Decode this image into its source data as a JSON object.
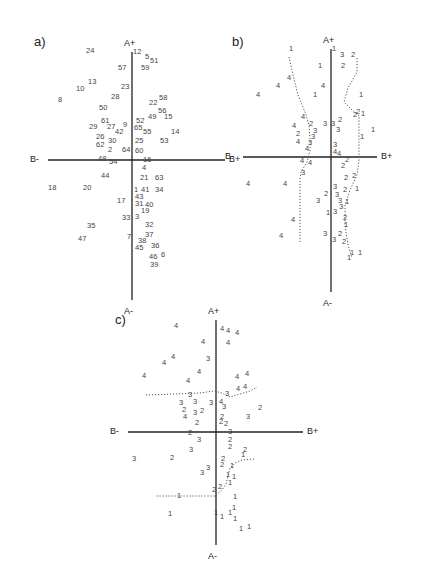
{
  "figure": {
    "panels": [
      {
        "id": "a",
        "label": "a)",
        "axes": {
          "top": "A+",
          "bottom": "A-",
          "left": "B-",
          "right": "B+"
        },
        "origin": [
          132,
          160
        ],
        "vline": [
          52,
          300
        ],
        "hline": [
          48,
          225
        ],
        "label_pos": [
          34,
          34
        ],
        "points": [
          {
            "t": "24",
            "x": 86,
            "y": 51
          },
          {
            "t": "12",
            "x": 133,
            "y": 52
          },
          {
            "t": "5",
            "x": 145,
            "y": 57
          },
          {
            "t": "51",
            "x": 150,
            "y": 61
          },
          {
            "t": "57",
            "x": 118,
            "y": 68
          },
          {
            "t": "59",
            "x": 141,
            "y": 68
          },
          {
            "t": "13",
            "x": 88,
            "y": 82
          },
          {
            "t": "10",
            "x": 76,
            "y": 89
          },
          {
            "t": "23",
            "x": 121,
            "y": 87
          },
          {
            "t": "8",
            "x": 58,
            "y": 100
          },
          {
            "t": "28",
            "x": 111,
            "y": 97
          },
          {
            "t": "22",
            "x": 149,
            "y": 103
          },
          {
            "t": "58",
            "x": 159,
            "y": 98
          },
          {
            "t": "50",
            "x": 99,
            "y": 108
          },
          {
            "t": "56",
            "x": 158,
            "y": 111
          },
          {
            "t": "49",
            "x": 148,
            "y": 117
          },
          {
            "t": "15",
            "x": 164,
            "y": 117
          },
          {
            "t": "61",
            "x": 101,
            "y": 121
          },
          {
            "t": "52",
            "x": 136,
            "y": 121
          },
          {
            "t": "9",
            "x": 123,
            "y": 125
          },
          {
            "t": "29",
            "x": 89,
            "y": 127
          },
          {
            "t": "27",
            "x": 107,
            "y": 127
          },
          {
            "t": "65",
            "x": 134,
            "y": 128
          },
          {
            "t": "42",
            "x": 115,
            "y": 132
          },
          {
            "t": "55",
            "x": 143,
            "y": 132
          },
          {
            "t": "14",
            "x": 171,
            "y": 132
          },
          {
            "t": "26",
            "x": 96,
            "y": 137
          },
          {
            "t": "30",
            "x": 108,
            "y": 141
          },
          {
            "t": "25",
            "x": 135,
            "y": 141
          },
          {
            "t": "53",
            "x": 160,
            "y": 141
          },
          {
            "t": "62",
            "x": 96,
            "y": 145
          },
          {
            "t": "2",
            "x": 108,
            "y": 150
          },
          {
            "t": "64",
            "x": 122,
            "y": 150
          },
          {
            "t": "60",
            "x": 135,
            "y": 151
          },
          {
            "t": "48",
            "x": 98,
            "y": 159
          },
          {
            "t": "54",
            "x": 109,
            "y": 162
          },
          {
            "t": "16",
            "x": 143,
            "y": 160
          },
          {
            "t": "4",
            "x": 142,
            "y": 168
          },
          {
            "t": "44",
            "x": 101,
            "y": 176
          },
          {
            "t": "21",
            "x": 140,
            "y": 178
          },
          {
            "t": "63",
            "x": 155,
            "y": 178
          },
          {
            "t": "18",
            "x": 48,
            "y": 188
          },
          {
            "t": "20",
            "x": 83,
            "y": 188
          },
          {
            "t": "1",
            "x": 134,
            "y": 190
          },
          {
            "t": "41",
            "x": 141,
            "y": 190
          },
          {
            "t": "34",
            "x": 155,
            "y": 190
          },
          {
            "t": "43",
            "x": 135,
            "y": 197
          },
          {
            "t": "17",
            "x": 117,
            "y": 201
          },
          {
            "t": "31",
            "x": 135,
            "y": 204
          },
          {
            "t": "40",
            "x": 145,
            "y": 205
          },
          {
            "t": "19",
            "x": 141,
            "y": 211
          },
          {
            "t": "3",
            "x": 135,
            "y": 217
          },
          {
            "t": "33",
            "x": 122,
            "y": 218
          },
          {
            "t": "35",
            "x": 87,
            "y": 226
          },
          {
            "t": "32",
            "x": 145,
            "y": 225
          },
          {
            "t": "37",
            "x": 145,
            "y": 235
          },
          {
            "t": "7",
            "x": 127,
            "y": 237
          },
          {
            "t": "47",
            "x": 78,
            "y": 239
          },
          {
            "t": "38",
            "x": 138,
            "y": 241
          },
          {
            "t": "36",
            "x": 151,
            "y": 246
          },
          {
            "t": "45",
            "x": 135,
            "y": 248
          },
          {
            "t": "46",
            "x": 149,
            "y": 257
          },
          {
            "t": "6",
            "x": 161,
            "y": 255
          },
          {
            "t": "39",
            "x": 150,
            "y": 265
          }
        ]
      },
      {
        "id": "b",
        "label": "b)",
        "axes": {
          "top": "A+",
          "bottom": "A-",
          "left": "B-",
          "right": "B+"
        },
        "origin": [
          331,
          157
        ],
        "vline": [
          49,
          292
        ],
        "hline": [
          243,
          377
        ],
        "label_pos": [
          232,
          34
        ],
        "points": [
          {
            "t": "1",
            "x": 289,
            "y": 49
          },
          {
            "t": "1",
            "x": 332,
            "y": 49
          },
          {
            "t": "3",
            "x": 340,
            "y": 55
          },
          {
            "t": "2",
            "x": 351,
            "y": 55
          },
          {
            "t": "1",
            "x": 318,
            "y": 66
          },
          {
            "t": "2",
            "x": 341,
            "y": 66
          },
          {
            "t": "4",
            "x": 287,
            "y": 78
          },
          {
            "t": "4",
            "x": 276,
            "y": 86
          },
          {
            "t": "4",
            "x": 321,
            "y": 86
          },
          {
            "t": "4",
            "x": 256,
            "y": 95
          },
          {
            "t": "1",
            "x": 313,
            "y": 95
          },
          {
            "t": "1",
            "x": 359,
            "y": 95
          },
          {
            "t": "2",
            "x": 356,
            "y": 112
          },
          {
            "t": "2",
            "x": 353,
            "y": 115
          },
          {
            "t": "1",
            "x": 361,
            "y": 114
          },
          {
            "t": "4",
            "x": 301,
            "y": 117
          },
          {
            "t": "2",
            "x": 309,
            "y": 124
          },
          {
            "t": "3",
            "x": 323,
            "y": 124
          },
          {
            "t": "3",
            "x": 331,
            "y": 124
          },
          {
            "t": "2",
            "x": 338,
            "y": 120
          },
          {
            "t": "4",
            "x": 292,
            "y": 126
          },
          {
            "t": "3",
            "x": 313,
            "y": 131
          },
          {
            "t": "3",
            "x": 336,
            "y": 130
          },
          {
            "t": "1",
            "x": 371,
            "y": 130
          },
          {
            "t": "2",
            "x": 296,
            "y": 134
          },
          {
            "t": "3",
            "x": 311,
            "y": 137
          },
          {
            "t": "1",
            "x": 360,
            "y": 137
          },
          {
            "t": "4",
            "x": 296,
            "y": 142
          },
          {
            "t": "3",
            "x": 308,
            "y": 143
          },
          {
            "t": "3",
            "x": 333,
            "y": 145
          },
          {
            "t": "4",
            "x": 305,
            "y": 149
          },
          {
            "t": "4",
            "x": 333,
            "y": 152
          },
          {
            "t": "4",
            "x": 337,
            "y": 154
          },
          {
            "t": "4",
            "x": 300,
            "y": 161
          },
          {
            "t": "4",
            "x": 308,
            "y": 163
          },
          {
            "t": "2",
            "x": 345,
            "y": 160
          },
          {
            "t": "2",
            "x": 341,
            "y": 166
          },
          {
            "t": "3",
            "x": 301,
            "y": 173
          },
          {
            "t": "2",
            "x": 352,
            "y": 176
          },
          {
            "t": "2",
            "x": 344,
            "y": 178
          },
          {
            "t": "4",
            "x": 246,
            "y": 184
          },
          {
            "t": "4",
            "x": 283,
            "y": 184
          },
          {
            "t": "3",
            "x": 333,
            "y": 187
          },
          {
            "t": "2",
            "x": 343,
            "y": 190
          },
          {
            "t": "1",
            "x": 355,
            "y": 189
          },
          {
            "t": "2",
            "x": 324,
            "y": 194
          },
          {
            "t": "3",
            "x": 335,
            "y": 195
          },
          {
            "t": "3",
            "x": 316,
            "y": 201
          },
          {
            "t": "3",
            "x": 338,
            "y": 201
          },
          {
            "t": "1",
            "x": 345,
            "y": 202
          },
          {
            "t": "3",
            "x": 339,
            "y": 207
          },
          {
            "t": "1",
            "x": 326,
            "y": 213
          },
          {
            "t": "3",
            "x": 333,
            "y": 212
          },
          {
            "t": "2",
            "x": 343,
            "y": 218
          },
          {
            "t": "4",
            "x": 291,
            "y": 220
          },
          {
            "t": "1",
            "x": 344,
            "y": 225
          },
          {
            "t": "3",
            "x": 323,
            "y": 234
          },
          {
            "t": "2",
            "x": 338,
            "y": 234
          },
          {
            "t": "4",
            "x": 279,
            "y": 236
          },
          {
            "t": "3",
            "x": 332,
            "y": 240
          },
          {
            "t": "2",
            "x": 342,
            "y": 242
          },
          {
            "t": "1",
            "x": 350,
            "y": 253
          },
          {
            "t": "1",
            "x": 358,
            "y": 253
          },
          {
            "t": "1",
            "x": 347,
            "y": 258
          }
        ],
        "dotted_paths": [
          "M289,57 L293,75 L298,95 L305,112 L309,125 L310,140 L310,150 L307,162 L301,172 L300,180 L300,242",
          "M357,58 L357,72 L348,88 L344,102 L352,110 L359,116 L359,135 L359,160 L357,175 L350,190 L345,205 L345,225 L348,245 L352,258"
        ]
      },
      {
        "id": "c",
        "label": "c)",
        "axes": {
          "top": "A+",
          "bottom": "A-",
          "left": "B-",
          "right": "B+"
        },
        "origin": [
          216,
          432
        ],
        "vline": [
          320,
          545
        ],
        "hline": [
          128,
          303
        ],
        "label_pos": [
          115,
          312
        ],
        "points": [
          {
            "t": "4",
            "x": 174,
            "y": 326
          },
          {
            "t": "4",
            "x": 220,
            "y": 329
          },
          {
            "t": "4",
            "x": 226,
            "y": 331
          },
          {
            "t": "4",
            "x": 235,
            "y": 333
          },
          {
            "t": "4",
            "x": 201,
            "y": 342
          },
          {
            "t": "4",
            "x": 226,
            "y": 343
          },
          {
            "t": "4",
            "x": 171,
            "y": 357
          },
          {
            "t": "3",
            "x": 206,
            "y": 359
          },
          {
            "t": "4",
            "x": 162,
            "y": 363
          },
          {
            "t": "4",
            "x": 197,
            "y": 372
          },
          {
            "t": "4",
            "x": 142,
            "y": 376
          },
          {
            "t": "4",
            "x": 235,
            "y": 377
          },
          {
            "t": "4",
            "x": 245,
            "y": 374
          },
          {
            "t": "4",
            "x": 186,
            "y": 381
          },
          {
            "t": "4",
            "x": 236,
            "y": 389
          },
          {
            "t": "4",
            "x": 243,
            "y": 387
          },
          {
            "t": "3",
            "x": 188,
            "y": 395
          },
          {
            "t": "3",
            "x": 225,
            "y": 394
          },
          {
            "t": "3",
            "x": 179,
            "y": 403
          },
          {
            "t": "3",
            "x": 193,
            "y": 402
          },
          {
            "t": "3",
            "x": 209,
            "y": 403
          },
          {
            "t": "4",
            "x": 219,
            "y": 402
          },
          {
            "t": "3",
            "x": 222,
            "y": 407
          },
          {
            "t": "2",
            "x": 258,
            "y": 408
          },
          {
            "t": "2",
            "x": 182,
            "y": 410
          },
          {
            "t": "3",
            "x": 193,
            "y": 413
          },
          {
            "t": "2",
            "x": 200,
            "y": 411
          },
          {
            "t": "3",
            "x": 246,
            "y": 417
          },
          {
            "t": "4",
            "x": 183,
            "y": 417
          },
          {
            "t": "2",
            "x": 220,
            "y": 417
          },
          {
            "t": "2",
            "x": 195,
            "y": 423
          },
          {
            "t": "2",
            "x": 219,
            "y": 422
          },
          {
            "t": "2",
            "x": 224,
            "y": 424
          },
          {
            "t": "2",
            "x": 188,
            "y": 433
          },
          {
            "t": "3",
            "x": 228,
            "y": 432
          },
          {
            "t": "3",
            "x": 197,
            "y": 440
          },
          {
            "t": "2",
            "x": 228,
            "y": 440
          },
          {
            "t": "2",
            "x": 228,
            "y": 447
          },
          {
            "t": "2",
            "x": 243,
            "y": 450
          },
          {
            "t": "3",
            "x": 189,
            "y": 450
          },
          {
            "t": "3",
            "x": 132,
            "y": 459
          },
          {
            "t": "2",
            "x": 170,
            "y": 458
          },
          {
            "t": "2",
            "x": 221,
            "y": 459
          },
          {
            "t": "1",
            "x": 241,
            "y": 455
          },
          {
            "t": "2",
            "x": 220,
            "y": 465
          },
          {
            "t": "1",
            "x": 230,
            "y": 466
          },
          {
            "t": "3",
            "x": 206,
            "y": 468
          },
          {
            "t": "3",
            "x": 200,
            "y": 473
          },
          {
            "t": "1",
            "x": 226,
            "y": 475
          },
          {
            "t": "1",
            "x": 232,
            "y": 477
          },
          {
            "t": "1",
            "x": 228,
            "y": 483
          },
          {
            "t": "2",
            "x": 218,
            "y": 487
          },
          {
            "t": "2",
            "x": 212,
            "y": 490
          },
          {
            "t": "1",
            "x": 177,
            "y": 496
          },
          {
            "t": "1",
            "x": 233,
            "y": 497
          },
          {
            "t": "1",
            "x": 168,
            "y": 514
          },
          {
            "t": "1",
            "x": 214,
            "y": 513
          },
          {
            "t": "1",
            "x": 228,
            "y": 513
          },
          {
            "t": "1",
            "x": 232,
            "y": 508
          },
          {
            "t": "1",
            "x": 220,
            "y": 517
          },
          {
            "t": "1",
            "x": 233,
            "y": 519
          },
          {
            "t": "1",
            "x": 239,
            "y": 529
          },
          {
            "t": "1",
            "x": 247,
            "y": 527
          }
        ],
        "dotted_paths": [
          "M146,395 L175,394 L200,393 L214,391 L222,393 L230,397 L240,394 L250,391 L257,387",
          "M254,459 L242,460 L235,463 L230,468 L228,476 L226,484 L222,490 L215,496 L200,496 L180,496 L155,496"
        ]
      }
    ],
    "caption_fragment": ""
  }
}
